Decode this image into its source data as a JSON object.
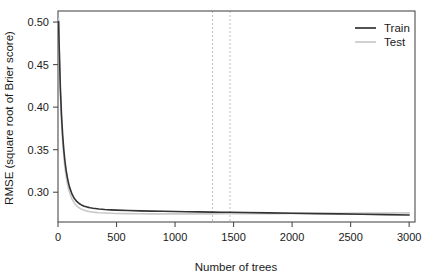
{
  "chart_data": {
    "type": "line",
    "title": "",
    "xlabel": "Number of trees",
    "ylabel": "RMSE (square root of Brier score)",
    "xlim": [
      0,
      3050
    ],
    "ylim": [
      0.265,
      0.513
    ],
    "xticks": [
      0,
      500,
      1000,
      1500,
      2000,
      2500,
      3000
    ],
    "xtick_labels": [
      "0",
      "500",
      "1000",
      "1500",
      "2000",
      "2500",
      "3000"
    ],
    "yticks": [
      0.3,
      0.35,
      0.4,
      0.45,
      0.5
    ],
    "ytick_labels": [
      "0.30",
      "0.35",
      "0.40",
      "0.45",
      "0.50"
    ],
    "grid": false,
    "legend_position": "top-right",
    "legend": [
      "Train",
      "Test"
    ],
    "colors": {
      "train": "#333333",
      "test": "#c9c9c9",
      "vline": "#c0c0c0",
      "axis": "#4d4d4d"
    },
    "annotations": [
      {
        "type": "vline",
        "x": 1320,
        "style": "dashed",
        "color": "#c0c0c0"
      },
      {
        "type": "vline",
        "x": 1470,
        "style": "dashed",
        "color": "#c0c0c0"
      }
    ],
    "x": [
      5,
      10,
      20,
      30,
      40,
      50,
      60,
      70,
      80,
      90,
      100,
      120,
      140,
      160,
      180,
      200,
      225,
      250,
      275,
      300,
      350,
      400,
      450,
      500,
      600,
      700,
      800,
      900,
      1000,
      1100,
      1200,
      1320,
      1400,
      1470,
      1600,
      1800,
      2000,
      2200,
      2400,
      2600,
      2800,
      3000
    ],
    "series": [
      {
        "name": "Train",
        "color": "#333333",
        "values": [
          0.5005,
          0.472,
          0.4235,
          0.3905,
          0.3668,
          0.3492,
          0.3358,
          0.3254,
          0.3172,
          0.3107,
          0.3054,
          0.2977,
          0.2926,
          0.2892,
          0.2868,
          0.2851,
          0.2836,
          0.2825,
          0.2817,
          0.2811,
          0.2803,
          0.2797,
          0.2793,
          0.279,
          0.2785,
          0.2781,
          0.2778,
          0.2776,
          0.2773,
          0.2771,
          0.2769,
          0.2766,
          0.2765,
          0.2764,
          0.2761,
          0.2757,
          0.2753,
          0.2749,
          0.2745,
          0.2741,
          0.2737,
          0.2733
        ]
      },
      {
        "name": "Test",
        "color": "#c9c9c9",
        "values": [
          0.504,
          0.47,
          0.4175,
          0.383,
          0.3588,
          0.3412,
          0.328,
          0.318,
          0.3102,
          0.304,
          0.299,
          0.2918,
          0.2871,
          0.2839,
          0.2817,
          0.2801,
          0.2787,
          0.2778,
          0.2771,
          0.2766,
          0.2759,
          0.2755,
          0.2752,
          0.275,
          0.2748,
          0.2747,
          0.2746,
          0.2746,
          0.2746,
          0.2746,
          0.2746,
          0.2746,
          0.2747,
          0.2747,
          0.2748,
          0.2749,
          0.2751,
          0.2752,
          0.2753,
          0.2755,
          0.2756,
          0.2757
        ]
      }
    ]
  },
  "plot_box": {
    "left": 58,
    "right": 415,
    "top": 11,
    "bottom": 222
  }
}
